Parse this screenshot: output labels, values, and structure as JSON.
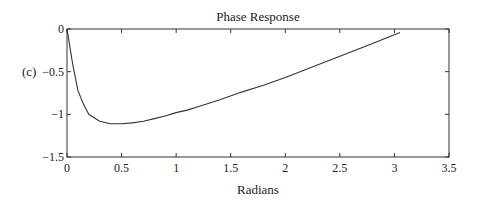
{
  "panel_label": "(c)",
  "chart_data": {
    "type": "line",
    "title": "Phase Response",
    "xlabel": "Radians",
    "ylabel": "",
    "xlim": [
      0,
      3.5
    ],
    "ylim": [
      -1.5,
      0
    ],
    "xticks": [
      0,
      0.5,
      1,
      1.5,
      2,
      2.5,
      3,
      3.5
    ],
    "xtick_labels": [
      "0",
      "0.5",
      "1",
      "1.5",
      "2",
      "2.5",
      "3",
      "3.5"
    ],
    "yticks": [
      0,
      -0.5,
      -1,
      -1.5
    ],
    "ytick_labels": [
      "0",
      "−0.5",
      "−1",
      "−1.5"
    ],
    "grid": false,
    "legend": null,
    "series": [
      {
        "name": "phase",
        "color": "#333333",
        "x": [
          0,
          0.05,
          0.1,
          0.15,
          0.2,
          0.3,
          0.4,
          0.5,
          0.6,
          0.7,
          0.8,
          0.9,
          1.0,
          1.1,
          1.2,
          1.4,
          1.6,
          1.8,
          2.0,
          2.2,
          2.4,
          2.6,
          2.8,
          3.05
        ],
        "y": [
          0,
          -0.4,
          -0.72,
          -0.88,
          -1.0,
          -1.08,
          -1.11,
          -1.11,
          -1.1,
          -1.08,
          -1.05,
          -1.02,
          -0.98,
          -0.95,
          -0.91,
          -0.83,
          -0.74,
          -0.66,
          -0.57,
          -0.47,
          -0.37,
          -0.27,
          -0.17,
          -0.04
        ]
      }
    ]
  }
}
